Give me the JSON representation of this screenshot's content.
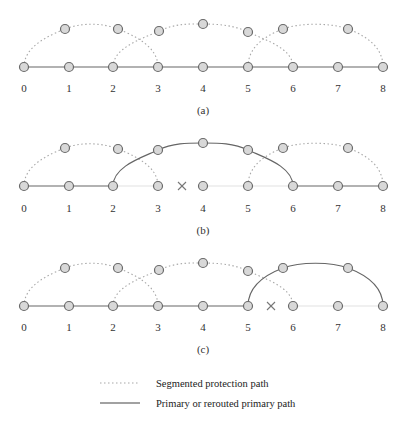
{
  "diagram": {
    "node_labels": [
      "0",
      "1",
      "2",
      "3",
      "4",
      "5",
      "6",
      "7",
      "8"
    ],
    "node_x": [
      24,
      69,
      113,
      158,
      203,
      248,
      293,
      338,
      383
    ],
    "panels": [
      {
        "id": "a",
        "caption": "(a)",
        "baseline_y": 67,
        "label_y": 92,
        "caption_y": 114,
        "primary_links": [
          [
            0,
            1
          ],
          [
            1,
            2
          ],
          [
            2,
            3
          ],
          [
            3,
            4
          ],
          [
            4,
            5
          ],
          [
            5,
            6
          ],
          [
            6,
            7
          ],
          [
            7,
            8
          ]
        ],
        "faint_links": [],
        "failure": null,
        "arcs": [
          {
            "type": "protection",
            "from": 0,
            "to": 3,
            "nodes": [
              [
                65,
                29
              ],
              [
                118,
                29
              ]
            ]
          },
          {
            "type": "protection",
            "from": 2,
            "to": 6,
            "nodes": [
              [
                159,
                31
              ],
              [
                203,
                24
              ],
              [
                248,
                32
              ]
            ]
          },
          {
            "type": "protection",
            "from": 5,
            "to": 8,
            "nodes": [
              [
                283,
                29
              ],
              [
                348,
                29
              ]
            ]
          }
        ]
      },
      {
        "id": "b",
        "caption": "(b)",
        "baseline_y": 186,
        "label_y": 212,
        "caption_y": 234,
        "primary_links": [
          [
            0,
            1
          ],
          [
            1,
            2
          ],
          [
            6,
            7
          ],
          [
            7,
            8
          ]
        ],
        "faint_links": [
          [
            2,
            3
          ],
          [
            4,
            5
          ],
          [
            5,
            6
          ]
        ],
        "failure": {
          "between": [
            3,
            4
          ],
          "x": 182
        },
        "arcs": [
          {
            "type": "protection",
            "from": 0,
            "to": 3,
            "nodes": [
              [
                65,
                148
              ],
              [
                118,
                149
              ]
            ]
          },
          {
            "type": "rerouted-primary",
            "from": 2,
            "to": 6,
            "nodes": [
              [
                158,
                150
              ],
              [
                203,
                143
              ],
              [
                248,
                150
              ]
            ]
          },
          {
            "type": "protection",
            "from": 5,
            "to": 8,
            "nodes": [
              [
                283,
                148
              ],
              [
                348,
                148
              ]
            ]
          }
        ]
      },
      {
        "id": "c",
        "caption": "(c)",
        "baseline_y": 306,
        "label_y": 331,
        "caption_y": 353,
        "primary_links": [
          [
            0,
            1
          ],
          [
            1,
            2
          ],
          [
            2,
            3
          ],
          [
            3,
            4
          ],
          [
            4,
            5
          ]
        ],
        "faint_links": [
          [
            6,
            7
          ],
          [
            7,
            8
          ]
        ],
        "failure": {
          "between": [
            5,
            6
          ],
          "x": 271
        },
        "arcs": [
          {
            "type": "protection",
            "from": 0,
            "to": 3,
            "nodes": [
              [
                65,
                268
              ],
              [
                118,
                268
              ]
            ]
          },
          {
            "type": "protection",
            "from": 2,
            "to": 6,
            "nodes": [
              [
                159,
                270
              ],
              [
                203,
                263
              ],
              [
                248,
                271
              ]
            ]
          },
          {
            "type": "rerouted-primary",
            "from": 5,
            "to": 8,
            "nodes": [
              [
                283,
                268
              ],
              [
                348,
                268
              ]
            ]
          }
        ]
      }
    ]
  },
  "legend": {
    "items": [
      {
        "style": "dotted",
        "label": "Segmented protection path"
      },
      {
        "style": "solid",
        "label": "Primary or rerouted primary path"
      }
    ]
  },
  "colors": {
    "node_fill": "#d8d8d8",
    "node_stroke": "#6a6a6a",
    "primary_line": "#666666",
    "protection_line": "#a8a8a8",
    "background": "#ffffff"
  }
}
